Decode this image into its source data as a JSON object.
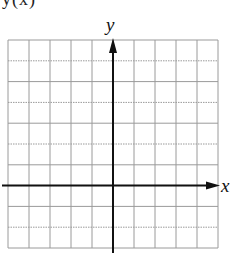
{
  "figure": {
    "top_fragment": "y(x)",
    "x_axis_label": "x",
    "y_axis_label": "y",
    "grid": {
      "columns": 10,
      "rows": 10,
      "left": 8,
      "top": 40,
      "cell_width": 21,
      "cell_height": 20.8,
      "line_color": "#9a9a9a",
      "axis_color": "#111111",
      "y_axis_column_index": 5,
      "x_axis_row_index": 7
    }
  }
}
